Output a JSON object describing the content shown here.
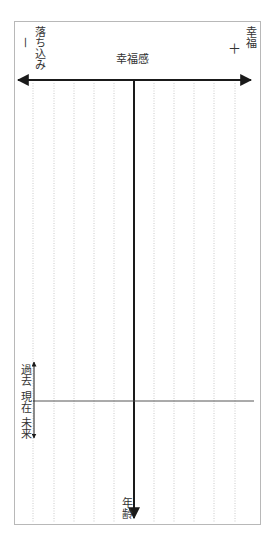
{
  "diagram": {
    "title": "幸福感",
    "left_label": "落ち込み",
    "left_sign": "－",
    "right_label": "幸福",
    "right_sign": "＋",
    "vertical_axis_label": "年齢",
    "timeline_labels": {
      "past": "過去",
      "present": "現在",
      "future": "未来"
    },
    "colors": {
      "axis": "#1a1a1a",
      "grid": "#bdbdbd",
      "border": "#b8b8b8"
    },
    "grid_line_count": 10
  }
}
